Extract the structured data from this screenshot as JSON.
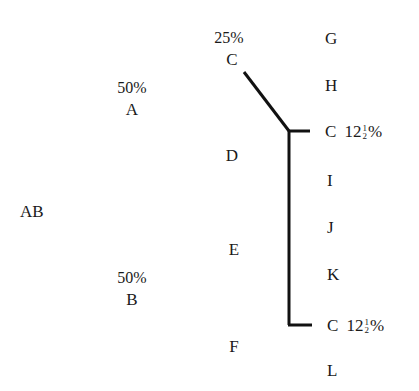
{
  "diagram": {
    "root": {
      "label": "AB"
    },
    "generation_1": [
      {
        "label": "A",
        "percent": "50%"
      },
      {
        "label": "B",
        "percent": "50%"
      }
    ],
    "generation_2": [
      {
        "label": "C",
        "percent": "25%"
      },
      {
        "label": "D"
      },
      {
        "label": "E"
      },
      {
        "label": "F"
      }
    ],
    "generation_3": [
      {
        "label": "G"
      },
      {
        "label": "H"
      },
      {
        "label": "C",
        "percent_whole": "12",
        "percent_num": "1",
        "percent_den": "2",
        "percent_sign": "%"
      },
      {
        "label": "I"
      },
      {
        "label": "J"
      },
      {
        "label": "K"
      },
      {
        "label": "C",
        "percent_whole": "12",
        "percent_num": "1",
        "percent_den": "2",
        "percent_sign": "%"
      },
      {
        "label": "L"
      }
    ],
    "connector_color": "#111111"
  }
}
